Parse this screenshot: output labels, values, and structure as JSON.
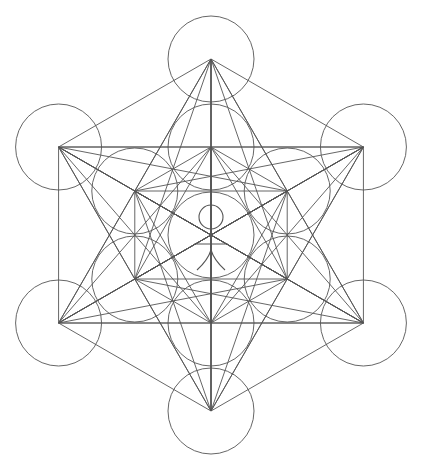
{
  "diagram": {
    "stroke_color": "#555555",
    "stroke_width": 0.9,
    "background": "#ffffff",
    "center": [
      211,
      235
    ],
    "circle_radius": 43,
    "inner_ring_distance": 88,
    "outer_ring_distance": 176,
    "figure": {
      "head": {
        "cx": 211,
        "cy": 217,
        "r": 12
      },
      "arms_y": 244,
      "arms_x": [
        194,
        228
      ],
      "spine_top": 229,
      "legs_y0": 250,
      "legs_y1": 264
    }
  }
}
